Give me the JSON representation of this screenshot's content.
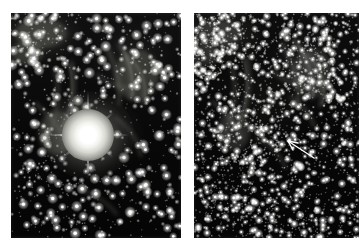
{
  "figure": {
    "background_color": "#ffffff",
    "panel_count": 2,
    "left_panel": {
      "name": "nova-in-outburst",
      "x": 11,
      "y": 13,
      "width": 170,
      "height": 225,
      "background_color": "#080808",
      "bright_object": {
        "label": "nova",
        "center_x": 88,
        "center_y": 135,
        "core_radius_px": 26,
        "halo_radius_px": 46,
        "diffraction_spikes": 6,
        "color": "#ffffff"
      },
      "star_count": 900,
      "nebulosity_present": true
    },
    "right_panel": {
      "name": "nova-at-quiescence",
      "x": 194,
      "y": 13,
      "width": 165,
      "height": 225,
      "background_color": "#070707",
      "star_count": 2600,
      "nebulosity_present": true,
      "marker": {
        "label": "arrow-marker",
        "tail_x": 314,
        "tail_y": 158,
        "head_x": 286,
        "head_y": 140,
        "color": "#ffffff",
        "points_to": "faint-star"
      }
    }
  },
  "labels": {
    "left_caption": "",
    "right_caption": "",
    "title": ""
  },
  "colors": {
    "page_background": "#ffffff",
    "sky": "#070707",
    "star": "#ffffff",
    "nebula": "#6e6e68",
    "marker": "#ffffff"
  }
}
